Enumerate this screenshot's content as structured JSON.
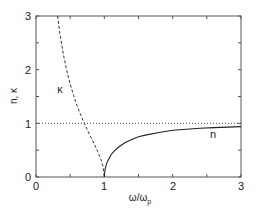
{
  "chart_data": {
    "type": "line",
    "title": "",
    "xlabel": "ω/ω",
    "xlabel_sub": "p",
    "ylabel": "n, κ",
    "xlim": [
      0,
      3
    ],
    "ylim": [
      0,
      3
    ],
    "xticks": [
      "0",
      "1",
      "2",
      "3"
    ],
    "yticks": [
      "0",
      "1",
      "2",
      "3"
    ],
    "grid": false,
    "legend": "none (inline curve labels)",
    "series": [
      {
        "name": "κ",
        "style": "dashed",
        "x": [
          0.316,
          0.35,
          0.4,
          0.45,
          0.5,
          0.55,
          0.6,
          0.65,
          0.7,
          0.75,
          0.8,
          0.85,
          0.9,
          0.95,
          0.98,
          1.0
        ],
        "y": [
          3.0,
          2.67,
          2.29,
          1.98,
          1.73,
          1.52,
          1.33,
          1.17,
          1.02,
          0.88,
          0.75,
          0.62,
          0.48,
          0.33,
          0.2,
          0.0
        ]
      },
      {
        "name": "n",
        "style": "solid",
        "x": [
          1.0,
          1.01,
          1.03,
          1.05,
          1.1,
          1.15,
          1.2,
          1.3,
          1.4,
          1.5,
          1.6,
          1.8,
          2.0,
          2.2,
          2.4,
          2.6,
          2.8,
          3.0
        ],
        "y": [
          0.0,
          0.14,
          0.24,
          0.3,
          0.42,
          0.49,
          0.55,
          0.64,
          0.7,
          0.75,
          0.78,
          0.83,
          0.87,
          0.89,
          0.91,
          0.92,
          0.93,
          0.94
        ]
      },
      {
        "name": "reference y=1",
        "style": "dotted",
        "x": [
          0,
          3
        ],
        "y": [
          1,
          1
        ]
      }
    ],
    "annotations": [
      {
        "text": "κ",
        "x": 0.35,
        "y": 1.62
      },
      {
        "text": "n",
        "x": 2.59,
        "y": 0.8
      }
    ]
  },
  "labels": {
    "xlabel_main": "ω/ω",
    "xlabel_sub": "p",
    "ylabel": "n, κ",
    "kappa": "κ",
    "n": "n",
    "xtick0": "0",
    "xtick1": "1",
    "xtick2": "2",
    "xtick3": "3",
    "ytick0": "0",
    "ytick1": "1",
    "ytick2": "2",
    "ytick3": "3"
  }
}
